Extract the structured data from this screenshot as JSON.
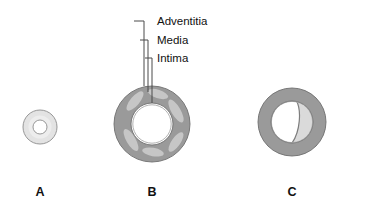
{
  "figure": {
    "background_color": "#ffffff",
    "type": "anatomical-diagram",
    "callouts": [
      {
        "id": "adventitia",
        "label": "Adventitia",
        "text_x": 150,
        "text_y": 25,
        "elbow_x": 134,
        "elbow_y": 21,
        "tick_x": 144,
        "drop_to_y": 86
      },
      {
        "id": "media",
        "label": "Media",
        "text_x": 150,
        "text_y": 44,
        "elbow_x": 140,
        "elbow_y": 40,
        "tick_x": 148,
        "drop_to_y": 92
      },
      {
        "id": "intima",
        "label": "Intima",
        "text_x": 150,
        "text_y": 62,
        "elbow_x": 145,
        "elbow_y": 58,
        "tick_x": 152,
        "drop_to_y": 103
      }
    ],
    "panels": [
      {
        "id": "panel-a",
        "letter": "A",
        "caption_x": 40,
        "caption_y": 196,
        "center_x": 40,
        "center_y": 127,
        "outer_radius": 17,
        "lumen_radius": 7,
        "wall_color": "#e3e3e3",
        "lumen_color": "#ffffff",
        "outline_color": "#8c8c8c"
      },
      {
        "id": "panel-b",
        "letter": "B",
        "caption_x": 152,
        "caption_y": 196,
        "center_x": 152,
        "center_y": 124,
        "outer_radius": 38,
        "lumen_radius": 21,
        "wall_color": "#9a9a9a",
        "lumen_color": "#ffffff",
        "plaque_color": "#c6c6c6",
        "outline_color": "#6e6e6e",
        "plaque_count": 6
      },
      {
        "id": "panel-c",
        "letter": "C",
        "caption_x": 292,
        "caption_y": 196,
        "center_x": 292,
        "center_y": 122,
        "outer_radius": 34,
        "lumen_radius": 21,
        "wall_color": "#9a9a9a",
        "true_lumen_color": "#ffffff",
        "false_lumen_color": "#dadada",
        "flap_color": "#7d7d7d",
        "outline_color": "#6e6e6e"
      }
    ]
  }
}
